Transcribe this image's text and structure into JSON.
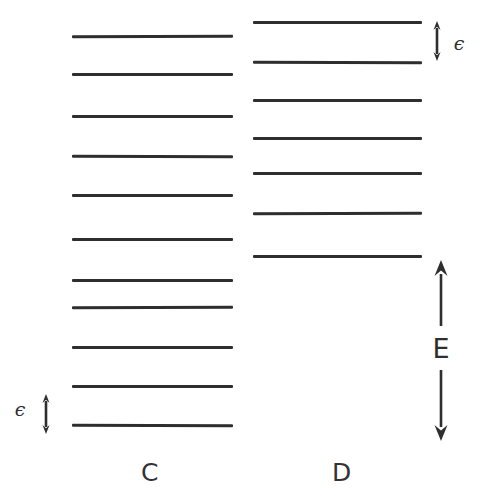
{
  "figure": {
    "width": 480,
    "height": 498,
    "background": "#ffffff",
    "line_color": "#2e2e2e",
    "text_color": "#333333"
  },
  "columns": [
    {
      "id": "C",
      "label": "C",
      "label_x": 150,
      "label_y": 472,
      "line_x_start": 72,
      "line_x_end": 233,
      "level_count": 11,
      "level_y": [
        36,
        74,
        116,
        156,
        195,
        239,
        280,
        307,
        347,
        386,
        425
      ]
    },
    {
      "id": "D",
      "label": "D",
      "label_x": 342,
      "label_y": 472,
      "line_x_start": 253,
      "line_x_end": 422,
      "level_count": 7,
      "level_y": [
        22,
        62,
        100,
        138,
        173,
        213,
        256
      ]
    }
  ],
  "annotations": [
    {
      "id": "epsilon-top-right",
      "symbol": "ϵ",
      "arrow_x": 437,
      "arrow_y_top": 21,
      "arrow_y_bottom": 61,
      "label_x": 459,
      "label_y": 43,
      "label_class": "eps-label"
    },
    {
      "id": "epsilon-bottom-left",
      "symbol": "ϵ",
      "arrow_x": 46,
      "arrow_y_top": 394,
      "arrow_y_bottom": 434,
      "label_x": 20,
      "label_y": 409,
      "label_class": "eps-label"
    },
    {
      "id": "energy-gap",
      "symbol": "E",
      "arrow_x": 441,
      "arrow_y_top": 260,
      "arrow_y_bottom": 441,
      "label_x": 441,
      "label_y": 348,
      "label_class": "e-label",
      "label_gap": 22
    }
  ],
  "chart_data": {
    "type": "diagram",
    "title": "",
    "series": [
      {
        "name": "C",
        "levels_y_px": [
          36,
          74,
          116,
          156,
          195,
          239,
          280,
          307,
          347,
          386,
          425
        ],
        "level_count": 11,
        "spacing_label": "ϵ"
      },
      {
        "name": "D",
        "levels_y_px": [
          22,
          62,
          100,
          138,
          173,
          213,
          256
        ],
        "level_count": 7,
        "spacing_label": "ϵ"
      }
    ],
    "annotations": [
      "ϵ",
      "ϵ",
      "E"
    ],
    "xlabel": "",
    "ylabel": "E",
    "grid": false,
    "legend": "none"
  }
}
